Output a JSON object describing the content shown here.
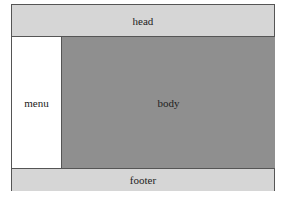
{
  "layout": {
    "head": "head",
    "menu": "menu",
    "body": "body",
    "footer": "footer"
  }
}
